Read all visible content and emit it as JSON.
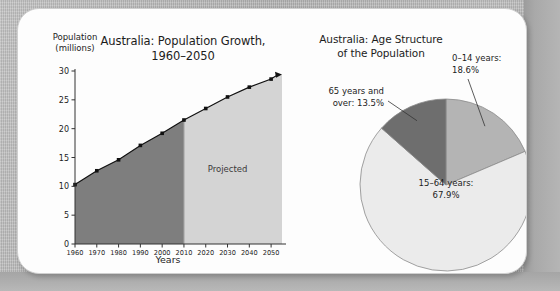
{
  "figure": {
    "background_color": "#b8b8b8",
    "panel_color": "#fdfdfd"
  },
  "chart_data": [
    {
      "type": "area",
      "title_line1": "Australia: Population Growth,",
      "title_line2": "1960–2050",
      "ylabel_line1": "Population",
      "ylabel_line2": "(millions)",
      "xlabel": "Years",
      "ylim": [
        0,
        30
      ],
      "xlim": [
        1960,
        2055
      ],
      "yticks": [
        "0",
        "5",
        "10",
        "15",
        "20",
        "25",
        "30"
      ],
      "ytick_values": [
        0,
        5,
        10,
        15,
        20,
        25,
        30
      ],
      "categories": [
        "1960",
        "1970",
        "1980",
        "1990",
        "2000",
        "2010",
        "2020",
        "2030",
        "2040",
        "2050"
      ],
      "x": [
        1960,
        1970,
        1980,
        1990,
        2000,
        2010,
        2020,
        2030,
        2040,
        2050
      ],
      "values": [
        10.3,
        12.7,
        14.6,
        17.1,
        19.2,
        21.5,
        23.5,
        25.5,
        27.2,
        28.6
      ],
      "series": [
        {
          "name": "Population (millions)",
          "values": [
            10.3,
            12.7,
            14.6,
            17.1,
            19.2,
            21.5,
            23.5,
            25.5,
            27.2,
            28.6
          ]
        }
      ],
      "annotations": [
        {
          "text": "Projected",
          "x": 2030,
          "y": 12.5
        }
      ],
      "regions": [
        {
          "name": "historical",
          "x_start": 1960,
          "x_end": 2010,
          "color": "#7e7e7e"
        },
        {
          "name": "projected",
          "x_start": 2010,
          "x_end": 2055,
          "color": "#d4d4d4"
        }
      ],
      "grid": false,
      "legend": "none",
      "marker": "square",
      "line_color": "#111111",
      "arrow_end": true
    },
    {
      "type": "pie",
      "title_line1": "Australia: Age Structure",
      "title_line2": "of the Population",
      "labels": [
        "0–14 years:",
        "15–64 years:",
        "65 years and"
      ],
      "categories": [
        "0–14 years",
        "15–64 years",
        "65 years and over"
      ],
      "values": [
        18.6,
        67.9,
        13.5
      ],
      "value_labels": [
        "18.6%",
        "67.9%",
        "13.5%"
      ],
      "colors": [
        "#b4b4b4",
        "#ebebeb",
        "#6e6e6e"
      ],
      "slice_labels": [
        {
          "line1": "0–14 years:",
          "line2": "18.6%"
        },
        {
          "line1": "15–64 years:",
          "line2": "67.9%"
        },
        {
          "line1": "65 years and",
          "line2": "over: 13.5%"
        }
      ],
      "start_angle_deg": 0,
      "direction": "clockwise",
      "legend": "callout-labels",
      "grid": false
    }
  ]
}
